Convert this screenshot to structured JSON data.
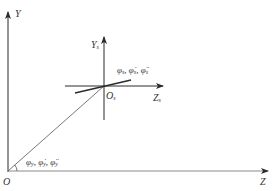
{
  "diagram": {
    "type": "coordinate-frame",
    "colors": {
      "axis": "#2a2a2a",
      "gray_axis": "#8a8a8a",
      "text": "#333333",
      "background": "#ffffff"
    },
    "global_frame": {
      "origin_label": "O",
      "y_label": "Y",
      "z_label": "Z"
    },
    "local_frame": {
      "origin_label": "O",
      "origin_sub": "s",
      "y_label": "Y",
      "y_sub": "s",
      "z_label": "Z",
      "z_sub": "s"
    },
    "local_rotation_label": {
      "parts": [
        "φ",
        "s",
        ", ",
        "φ̇",
        "s",
        ", ",
        "φ̈",
        "s"
      ],
      "text": "φs, φ̇s, φ̈s"
    },
    "global_angle_label": {
      "parts": [
        "φ",
        "y",
        ", ",
        "φ̇",
        "y",
        ", ",
        "φ̈",
        "y"
      ],
      "text": "φy, φ̇y, φ̈y"
    }
  }
}
